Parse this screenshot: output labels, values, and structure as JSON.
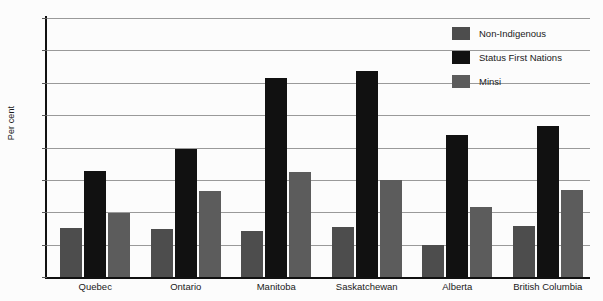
{
  "chart_data": {
    "type": "bar",
    "title": "",
    "xlabel": "",
    "ylabel": "Per cent",
    "ylim": [
      0,
      80
    ],
    "yticks": [
      0,
      10,
      20,
      30,
      40,
      50,
      60,
      70,
      80
    ],
    "grid": true,
    "legend_position": "top-right",
    "categories": [
      "Quebec",
      "Ontario",
      "Manitoba",
      "Saskatchewan",
      "Alberta",
      "British Columbia"
    ],
    "series": [
      {
        "name": "Non-Indigenous",
        "color": "#4d4d4d",
        "values": [
          15.0,
          14.9,
          14.3,
          15.4,
          10.0,
          15.8
        ]
      },
      {
        "name": "Status First Nations",
        "color": "#111111",
        "values": [
          32.7,
          39.5,
          61.5,
          63.5,
          44.0,
          46.8
        ]
      },
      {
        "name": "Minsi",
        "color": "#5c5c5c",
        "values": [
          19.8,
          26.5,
          32.4,
          30.1,
          21.7,
          27.0
        ]
      }
    ]
  }
}
